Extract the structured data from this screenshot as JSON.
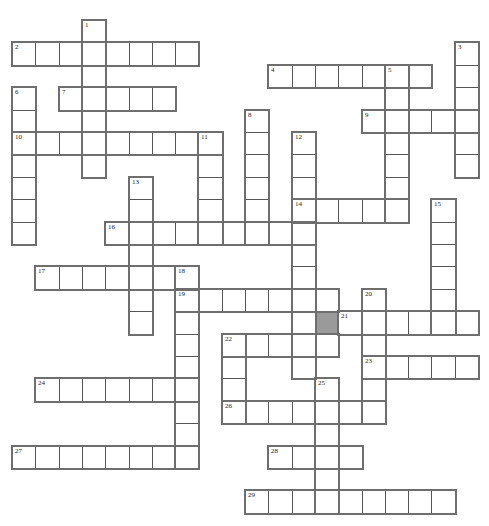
{
  "puzzle": {
    "type": "crossword",
    "grid": {
      "origin_x": 12,
      "origin_y": 20,
      "cell_w": 23.3,
      "cell_h": 22.4,
      "cols": 20,
      "rows": 22
    },
    "colors": {
      "cell_border": "#555555",
      "outline": "#6e6e6e",
      "shaded": "#9a9a9a",
      "background": "#ffffff"
    },
    "shaded_cells": [
      {
        "row": 13,
        "col": 13
      }
    ],
    "entries": [
      {
        "number": "1",
        "dir": "down",
        "row": 0,
        "col": 3,
        "length": 7
      },
      {
        "number": "2",
        "dir": "across",
        "row": 1,
        "col": 0,
        "length": 8
      },
      {
        "number": "3",
        "dir": "down",
        "row": 1,
        "col": 19,
        "length": 6
      },
      {
        "number": "4",
        "dir": "across",
        "row": 2,
        "col": 11,
        "length": 7
      },
      {
        "number": "5",
        "dir": "down",
        "row": 2,
        "col": 16,
        "length": 7
      },
      {
        "number": "6",
        "dir": "down",
        "row": 3,
        "col": 0,
        "length": 7
      },
      {
        "number": "7",
        "dir": "across",
        "row": 3,
        "col": 2,
        "length": 5
      },
      {
        "number": "8",
        "dir": "down",
        "row": 4,
        "col": 10,
        "length": 6
      },
      {
        "number": "9",
        "dir": "across",
        "row": 4,
        "col": 15,
        "length": 5
      },
      {
        "number": "10",
        "dir": "across",
        "row": 5,
        "col": 0,
        "length": 9
      },
      {
        "number": "11",
        "dir": "down",
        "row": 5,
        "col": 8,
        "length": 5
      },
      {
        "number": "12",
        "dir": "down",
        "row": 5,
        "col": 12,
        "length": 11
      },
      {
        "number": "13",
        "dir": "down",
        "row": 7,
        "col": 5,
        "length": 7
      },
      {
        "number": "14",
        "dir": "across",
        "row": 8,
        "col": 12,
        "length": 5
      },
      {
        "number": "15",
        "dir": "down",
        "row": 8,
        "col": 18,
        "length": 6
      },
      {
        "number": "16",
        "dir": "across",
        "row": 9,
        "col": 4,
        "length": 9
      },
      {
        "number": "17",
        "dir": "across",
        "row": 11,
        "col": 1,
        "length": 7
      },
      {
        "number": "18",
        "dir": "down",
        "row": 11,
        "col": 7,
        "length": 9
      },
      {
        "number": "19",
        "dir": "across",
        "row": 12,
        "col": 7,
        "length": 7
      },
      {
        "number": "20",
        "dir": "down",
        "row": 12,
        "col": 15,
        "length": 6
      },
      {
        "number": "21",
        "dir": "across",
        "row": 13,
        "col": 14,
        "length": 6
      },
      {
        "number": "22",
        "dir": "across",
        "row": 14,
        "col": 9,
        "length": 5
      },
      {
        "number": "22",
        "dir": "down",
        "row": 14,
        "col": 9,
        "length": 4
      },
      {
        "number": "23",
        "dir": "across",
        "row": 15,
        "col": 15,
        "length": 5
      },
      {
        "number": "24",
        "dir": "across",
        "row": 16,
        "col": 1,
        "length": 7
      },
      {
        "number": "25",
        "dir": "down",
        "row": 16,
        "col": 13,
        "length": 6
      },
      {
        "number": "26",
        "dir": "across",
        "row": 17,
        "col": 9,
        "length": 7
      },
      {
        "number": "27",
        "dir": "across",
        "row": 19,
        "col": 0,
        "length": 8
      },
      {
        "number": "28",
        "dir": "across",
        "row": 19,
        "col": 11,
        "length": 4
      },
      {
        "number": "29",
        "dir": "across",
        "row": 21,
        "col": 10,
        "length": 9
      }
    ]
  }
}
